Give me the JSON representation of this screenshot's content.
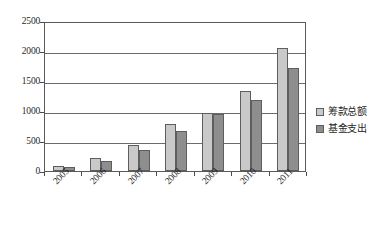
{
  "chart_data": {
    "type": "bar",
    "title": "",
    "subtitle": "",
    "xlabel": "",
    "ylabel": "",
    "categories": [
      "2005",
      "2006",
      "2007",
      "2008",
      "2009",
      "2010",
      "2011"
    ],
    "series": [
      {
        "name": "筹款总额",
        "color": "#c9c9c9",
        "values": [
          80,
          215,
          440,
          790,
          960,
          1330,
          2050
        ]
      },
      {
        "name": "基金支出",
        "color": "#8e8e8e",
        "values": [
          60,
          165,
          355,
          665,
          950,
          1190,
          1720
        ]
      }
    ],
    "ylim": [
      0,
      2500
    ],
    "ytick_labels": [
      "0",
      "500",
      "1000",
      "1500",
      "2000",
      "2500"
    ],
    "ytick_values": [
      0,
      500,
      1000,
      1500,
      2000,
      2500
    ],
    "grid": true,
    "grid_axis": "y",
    "legend_position": "right",
    "xtick_rotation": -45
  },
  "legend": {
    "entries": [
      {
        "label": "筹款总额"
      },
      {
        "label": "基金支出"
      }
    ]
  }
}
